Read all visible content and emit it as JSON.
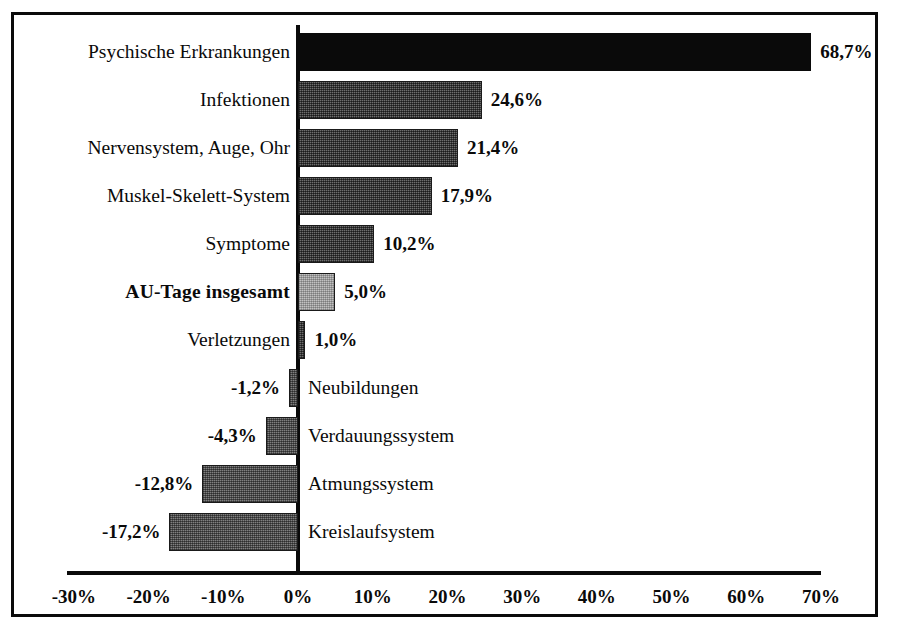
{
  "chart_data": {
    "type": "bar",
    "orientation": "horizontal",
    "title": "",
    "subtitle": "",
    "xlabel": "",
    "ylabel": "",
    "xlim": [
      -30,
      70
    ],
    "grid": false,
    "legend": null,
    "axis_ticks": [
      "-30%",
      "-20%",
      "-10%",
      "0%",
      "10%",
      "20%",
      "30%",
      "40%",
      "50%",
      "60%",
      "70%"
    ],
    "axis_tick_values": [
      -30,
      -20,
      -10,
      0,
      10,
      20,
      30,
      40,
      50,
      60,
      70
    ],
    "categories": [
      "Psychische Erkrankungen",
      "Infektionen",
      "Nervensystem, Auge, Ohr",
      "Muskel-Skelett-System",
      "Symptome",
      "AU-Tage insgesamt",
      "Verletzungen",
      "Neubildungen",
      "Verdauungssystem",
      "Atmungssystem",
      "Kreislaufsystem"
    ],
    "values": [
      68.7,
      24.6,
      21.4,
      17.9,
      10.2,
      5.0,
      1.0,
      -1.2,
      -4.3,
      -12.8,
      -17.2
    ],
    "value_labels": [
      "68,7%",
      "24,6%",
      "21,4%",
      "17,9%",
      "10,2%",
      "5,0%",
      "1,0%",
      "-1,2%",
      "-4,3%",
      "-12,8%",
      "-17,2%"
    ],
    "bar_styles": [
      "fill-black",
      "fill-darkgray",
      "fill-darkgray",
      "fill-darkgray",
      "fill-darkgray",
      "fill-lightgray",
      "fill-darkgray",
      "fill-midgray",
      "fill-midgray",
      "fill-midgray",
      "fill-midgray"
    ],
    "highlighted_category": "AU-Tage insgesamt",
    "colors": {
      "axis": "#0a0a0a",
      "border": "#0a0a0a",
      "background": "#ffffff",
      "bar_black": "#0a0a0a",
      "bar_dark_gray": "#6e6e6e",
      "bar_mid_gray": "#808080",
      "bar_light_gray": "#c2c2c2"
    }
  }
}
